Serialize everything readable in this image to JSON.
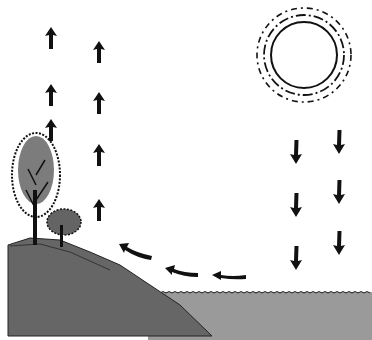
{
  "diagram": {
    "elements": [
      {
        "id": "sun",
        "type": "sun-icon"
      },
      {
        "id": "incoming-radiation",
        "type": "down-arrows",
        "count": 6
      },
      {
        "id": "evaporation",
        "type": "curved-arrows",
        "count": 3
      },
      {
        "id": "transpiration",
        "type": "up-arrows",
        "count": 7
      },
      {
        "id": "trees",
        "type": "tree-icons",
        "count": 2
      },
      {
        "id": "hill",
        "type": "land"
      },
      {
        "id": "water",
        "type": "water-body"
      }
    ],
    "colors": {
      "land": "#6a6a6a",
      "water": "#9a9a9a",
      "ink": "#111111",
      "background": "#ffffff"
    }
  }
}
